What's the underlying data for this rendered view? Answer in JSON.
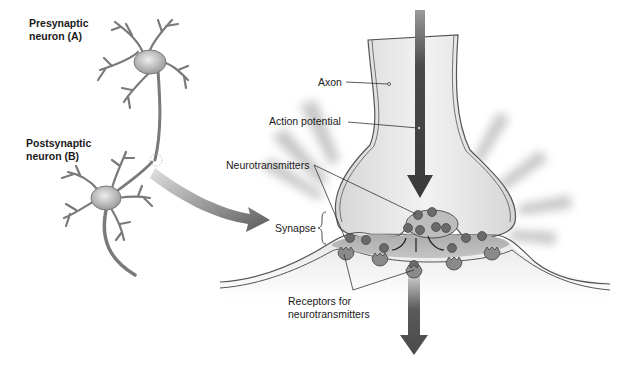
{
  "diagram": {
    "labels": {
      "presynaptic_line1": "Presynaptic",
      "presynaptic_line2": "neuron (A)",
      "postsynaptic_line1": "Postsynaptic",
      "postsynaptic_line2": "neuron (B)",
      "axon": "Axon",
      "action_potential": "Action potential",
      "neurotransmitters": "Neurotransmitters",
      "synapse": "Synapse",
      "receptors_line1": "Receptors for",
      "receptors_line2": "neurotransmitters"
    },
    "colors": {
      "cell_fill": "#cfcfcf",
      "cell_dark": "#8c8c8c",
      "membrane": "#555555",
      "arrow": "#4a4a4a",
      "text": "#1a1a1a",
      "background": "#ffffff"
    }
  }
}
